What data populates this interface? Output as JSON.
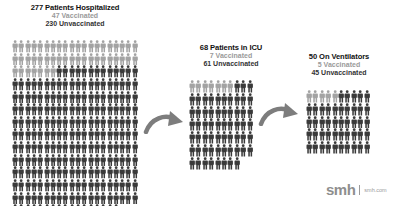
{
  "colors": {
    "vaccinated": "#a3a3a3",
    "unvaccinated": "#3a3a3a",
    "arrow": "#7d7d7d",
    "logo": "#8e8e8e"
  },
  "icons": {
    "person": "person-icon",
    "arrow": "curved-arrow-icon"
  },
  "stages": [
    {
      "id": "hospitalized",
      "headline": "277 Patients Hospitalized",
      "vaccinated_label": "47 Vaccinated",
      "unvaccinated_label": "230 Unvaccinated",
      "total": 277,
      "vaccinated": 47,
      "unvaccinated": 230,
      "columns": 20
    },
    {
      "id": "icu",
      "headline": "68 Patients in ICU",
      "vaccinated_label": "7 Vaccinated",
      "unvaccinated_label": "61 Unvaccinated",
      "total": 68,
      "vaccinated": 7,
      "unvaccinated": 61,
      "columns": 10
    },
    {
      "id": "ventilators",
      "headline": "50 On Ventilators",
      "vaccinated_label": "5 Vaccinated",
      "unvaccinated_label": "45 Unvaccinated",
      "total": 50,
      "vaccinated": 5,
      "unvaccinated": 45,
      "columns": 10
    }
  ],
  "brand": {
    "logo": "smh",
    "domain": "smh.com"
  }
}
